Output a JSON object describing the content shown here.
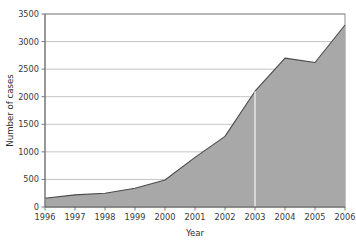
{
  "chart_data": {
    "type": "area",
    "title": "",
    "subtitle": "",
    "xlabel": "Year",
    "ylabel": "Number of cases",
    "categories": [
      1996,
      1997,
      1998,
      1999,
      2000,
      2001,
      2002,
      2003,
      2004,
      2005,
      2006
    ],
    "x": [
      1996,
      1997,
      1998,
      1999,
      2000,
      2001,
      2002,
      2003,
      2004,
      2005,
      2006
    ],
    "values": [
      160,
      220,
      250,
      340,
      490,
      900,
      1280,
      2100,
      2700,
      2620,
      3300
    ],
    "series": [
      {
        "name": "Number of cases",
        "values": [
          160,
          220,
          250,
          340,
          490,
          900,
          1280,
          2100,
          2700,
          2620,
          3300
        ]
      }
    ],
    "xlim": [
      1996,
      2006
    ],
    "ylim": [
      0,
      3500
    ],
    "ytick_values": [
      0,
      500,
      1000,
      1500,
      2000,
      2500,
      3000,
      3500
    ],
    "ytick_labels": [
      "0",
      "500",
      "1000",
      "1500",
      "2000",
      "2500",
      "3000",
      "3500"
    ],
    "xtick_values": [
      1996,
      1997,
      1998,
      1999,
      2000,
      2001,
      2002,
      2003,
      2004,
      2005,
      2006
    ],
    "xtick_labels": [
      "1996",
      "1997",
      "1998",
      "1999",
      "2000",
      "2001",
      "2002",
      "2003",
      "2004",
      "2005",
      "2006"
    ],
    "grid": "horizontal",
    "legend": "none",
    "annotations": [
      {
        "name": "vertical-marker-2003",
        "x": 2003,
        "color": "#ffffff"
      }
    ],
    "colors": {
      "area_fill": "#a8a8a8",
      "area_line": "#4a4a4a",
      "grid": "#bdbdbd",
      "axis": "#7a7a7a",
      "text": "#3a3a3a",
      "background": "#ffffff"
    }
  }
}
